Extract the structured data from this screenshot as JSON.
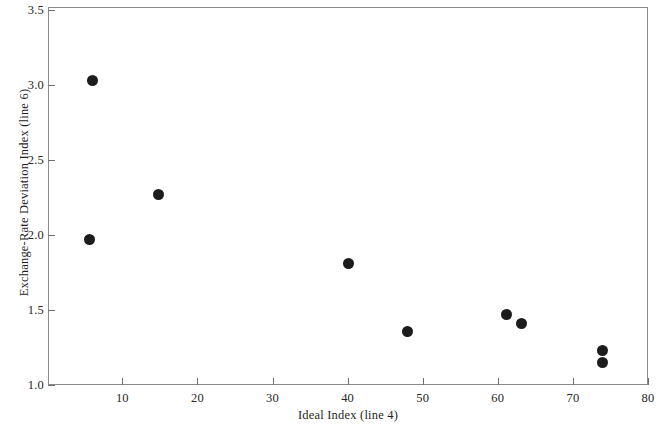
{
  "chart_data": {
    "type": "scatter",
    "title": "",
    "xlabel": "Ideal Index (line 4)",
    "ylabel": "Exchange-Rate Deviation Index (line 6)",
    "xlim": [
      0.1,
      80
    ],
    "ylim": [
      1.0,
      3.52
    ],
    "xticks": [
      10,
      20,
      30,
      40,
      50,
      60,
      70,
      80
    ],
    "xtick_labels": [
      "10",
      "20",
      "30",
      "40",
      "50",
      "60",
      "70",
      "80"
    ],
    "yticks": [
      1.0,
      1.5,
      2.0,
      2.5,
      3.0,
      3.5
    ],
    "ytick_labels": [
      "1.0",
      "1.5",
      "2.0",
      "2.5",
      "3.0",
      "3.5"
    ],
    "grid": false,
    "legend": null,
    "marker": "filled-circle",
    "marker_color": "#1c1c1c",
    "frame_color": "#8b8b8b",
    "background": "#ffffff",
    "points": [
      {
        "x": 6.0,
        "y": 3.03
      },
      {
        "x": 5.6,
        "y": 1.97
      },
      {
        "x": 14.8,
        "y": 2.27
      },
      {
        "x": 40.1,
        "y": 1.81
      },
      {
        "x": 48.0,
        "y": 1.36
      },
      {
        "x": 61.2,
        "y": 1.47
      },
      {
        "x": 63.1,
        "y": 1.41
      },
      {
        "x": 74.0,
        "y": 1.23
      },
      {
        "x": 74.0,
        "y": 1.15
      }
    ]
  }
}
